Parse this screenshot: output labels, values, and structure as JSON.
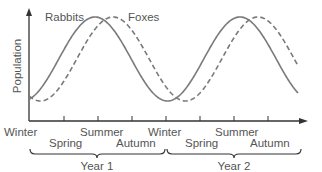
{
  "colors": {
    "curve": "#7a7a7a",
    "axis": "#333333",
    "text": "#555555"
  },
  "chart_data": {
    "type": "line",
    "title": "",
    "xlabel": "",
    "ylabel": "Population",
    "x_ticks": [
      "Winter",
      "Spring",
      "Summer",
      "Autumn",
      "Winter",
      "Spring",
      "Summer",
      "Autumn"
    ],
    "groups": [
      {
        "label": "Year 1",
        "span": [
          "Winter",
          "Autumn"
        ]
      },
      {
        "label": "Year 2",
        "span": [
          "Winter",
          "Autumn"
        ]
      }
    ],
    "series": [
      {
        "name": "Rabbits",
        "style": "solid",
        "description": "sinusoidal, peaks near Spring/Summer each year"
      },
      {
        "name": "Foxes",
        "style": "dashed",
        "description": "sinusoidal, lagging rabbits by about half a season, peaks near Summer each year"
      }
    ],
    "grid": false
  },
  "labels": {
    "ylabel": "Population",
    "rabbits": "Rabbits",
    "foxes": "Foxes",
    "seasons": [
      {
        "text": "Winter",
        "x": 4,
        "y": 136
      },
      {
        "text": "Spring",
        "x": 49,
        "y": 147
      },
      {
        "text": "Summer",
        "x": 80,
        "y": 136
      },
      {
        "text": "Autumn",
        "x": 116,
        "y": 147
      },
      {
        "text": "Winter",
        "x": 148,
        "y": 136
      },
      {
        "text": "Spring",
        "x": 185,
        "y": 147
      },
      {
        "text": "Summer",
        "x": 215,
        "y": 136
      },
      {
        "text": "Autumn",
        "x": 250,
        "y": 147
      }
    ],
    "year1": "Year 1",
    "year2": "Year 2"
  }
}
